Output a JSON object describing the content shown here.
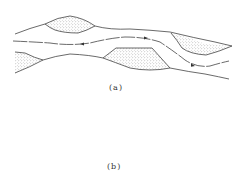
{
  "figure": {
    "panels": [
      {
        "id": "a",
        "caption": "(a)",
        "description": "Braided/meandering channel with alternating sand bars (stippled) and thalweg flow line with arrows"
      },
      {
        "id": "b",
        "caption": "(b)",
        "description": "Straight channel with small alternate bars along both banks and flow arrows pointing left"
      }
    ],
    "colors": {
      "line": "#444444",
      "stipple": "#888888",
      "background": "#ffffff"
    }
  }
}
